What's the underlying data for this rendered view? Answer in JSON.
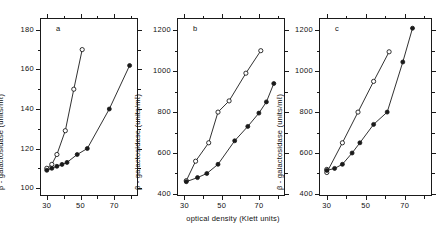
{
  "figure": {
    "xlabel": "optical density (Klett units)",
    "ylabel": "β - galactosidase  (units/mℓ)",
    "panels": [
      {
        "letter": "a"
      },
      {
        "letter": "b"
      },
      {
        "letter": "c"
      }
    ]
  },
  "chart_data": [
    {
      "type": "scatter",
      "title": "a",
      "xlabel": "optical density (Klett units)",
      "ylabel": "β - galactosidase (units/ml)",
      "xlim": [
        26,
        84
      ],
      "ylim": [
        96,
        186
      ],
      "xticks": [
        30,
        50,
        70
      ],
      "xticklabels": [
        "30",
        "50",
        "70"
      ],
      "xminorticks": [
        40,
        60,
        80
      ],
      "yticks": [
        100,
        120,
        140,
        160,
        180
      ],
      "yticklabels": [
        "100",
        "120",
        "140",
        "160",
        "180"
      ],
      "yminorticks": [
        110,
        130,
        150,
        170
      ],
      "grid": false,
      "legend": "none",
      "series": [
        {
          "name": "open-circles",
          "marker": "open-circle",
          "x": [
            30,
            33,
            36,
            41,
            46,
            51
          ],
          "y": [
            110,
            112,
            117,
            129,
            150,
            170
          ]
        },
        {
          "name": "filled-circles",
          "marker": "filled-circle",
          "x": [
            30,
            33,
            36,
            39,
            42,
            48,
            54,
            67,
            79
          ],
          "y": [
            109,
            110,
            111,
            112,
            113,
            117,
            120,
            140,
            162
          ]
        }
      ]
    },
    {
      "type": "scatter",
      "title": "b",
      "xlabel": "optical density (Klett units)",
      "ylabel": "β - galactosidase (units/ml)",
      "xlim": [
        26,
        84
      ],
      "ylim": [
        390,
        1260
      ],
      "xticks": [
        30,
        50,
        70
      ],
      "xticklabels": [
        "30",
        "50",
        "70"
      ],
      "xminorticks": [
        40,
        60,
        80
      ],
      "yticks": [
        400,
        600,
        800,
        1000,
        1200
      ],
      "yticklabels": [
        "400",
        "600",
        "800",
        "1000",
        "1200"
      ],
      "yminorticks": [
        500,
        700,
        900,
        1100
      ],
      "grid": false,
      "legend": "none",
      "series": [
        {
          "name": "open-circles",
          "marker": "open-circle",
          "x": [
            31,
            36,
            43,
            48,
            54,
            63,
            71
          ],
          "y": [
            465,
            560,
            650,
            800,
            855,
            990,
            1100
          ]
        },
        {
          "name": "filled-circles",
          "marker": "filled-circle",
          "x": [
            31,
            37,
            42,
            48,
            57,
            64,
            70,
            74,
            78
          ],
          "y": [
            460,
            480,
            500,
            545,
            660,
            730,
            795,
            850,
            940
          ]
        }
      ]
    },
    {
      "type": "scatter",
      "title": "c",
      "xlabel": "optical density (Klett units)",
      "ylabel": "β - galactosidase (units/ml)",
      "xlim": [
        26,
        84
      ],
      "ylim": [
        390,
        1260
      ],
      "xticks": [
        30,
        50,
        70
      ],
      "xticklabels": [
        "30",
        "50",
        "70"
      ],
      "xminorticks": [
        40,
        60,
        80
      ],
      "yticks": [
        400,
        600,
        800,
        1000,
        1200
      ],
      "yticklabels": [
        "400",
        "600",
        "800",
        "1000",
        "1200"
      ],
      "yminorticks": [
        500,
        700,
        900,
        1100
      ],
      "grid": false,
      "legend": "none",
      "series": [
        {
          "name": "open-circles",
          "marker": "open-circle",
          "x": [
            30,
            30,
            38,
            46,
            54,
            62
          ],
          "y": [
            520,
            505,
            650,
            800,
            950,
            1095
          ]
        },
        {
          "name": "filled-circles",
          "marker": "filled-circle",
          "x": [
            30,
            34,
            38,
            43,
            47,
            54,
            61,
            69,
            74
          ],
          "y": [
            515,
            525,
            545,
            600,
            650,
            740,
            800,
            1045,
            1210
          ]
        }
      ]
    }
  ]
}
